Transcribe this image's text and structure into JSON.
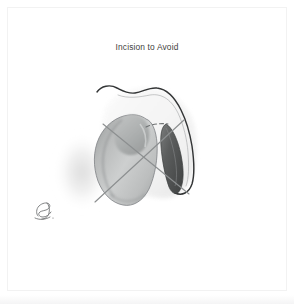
{
  "figure": {
    "title": "Incision to Avoid",
    "title_color": "#3f3f41",
    "background_color": "#ffffff",
    "frame_color": "#f2f2f2",
    "medium": "grayscale-anatomical-illustration"
  },
  "illustration": {
    "description": "Grayscale anatomical drawing with an X drawn over the organ marking an incision path to avoid",
    "elements": [
      {
        "name": "body-contour-line",
        "label": "Body contour",
        "color": "#3a3a3a",
        "style": "solid"
      },
      {
        "name": "teardrop-organ",
        "label": "Organ",
        "fill_light": "#d9dada",
        "fill_mid": "#b3b5b5",
        "fill_dark": "#8e9191",
        "outline": "#7d8081"
      },
      {
        "name": "dark-duct-structure",
        "label": "Duct structure",
        "fill_light": "#6b6d6d",
        "fill_dark": "#4a4c4c",
        "outline": "#3c3e3e"
      },
      {
        "name": "soft-shadow-ellipse",
        "label": "Shadow",
        "color": "#e8e8e8"
      },
      {
        "name": "incision-cross-mark",
        "label": "Incision to avoid (X mark)",
        "color": "#8c8f90",
        "style": "solid",
        "stroke_width": "1.1"
      },
      {
        "name": "dashed-guide-line",
        "label": "Dashed guide",
        "color": "#6e7172",
        "style": "dashed"
      }
    ]
  },
  "signature": {
    "name": "artist-monogram",
    "label": "Artist monogram",
    "color": "#6d6f70"
  }
}
